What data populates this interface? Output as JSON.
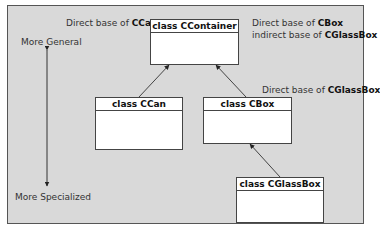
{
  "diagram": {
    "classes": [
      {
        "id": "ccontainer",
        "name": "class CContainer"
      },
      {
        "id": "ccan",
        "name": "class CCan"
      },
      {
        "id": "cbox",
        "name": "class CBox"
      },
      {
        "id": "cglassbox",
        "name": "class CGlassBox"
      }
    ],
    "annotations": {
      "ccan_base": {
        "prefix": "Direct base of ",
        "bold": "CCan"
      },
      "cbox_base": {
        "prefix": "Direct base of ",
        "bold": "CBox"
      },
      "cglassbox_indirect": {
        "prefix": "indirect base of ",
        "bold": "CGlassBox"
      },
      "cglassbox_direct": {
        "prefix": "Direct base of ",
        "bold": "CGlassBox"
      }
    },
    "axis": {
      "top_label": "More General",
      "bottom_label": "More Specialized"
    },
    "edges": [
      {
        "from": "CCan",
        "to": "CContainer"
      },
      {
        "from": "CBox",
        "to": "CContainer"
      },
      {
        "from": "CGlassBox",
        "to": "CBox"
      }
    ]
  },
  "colors": {
    "panel": "#d9d9d9",
    "box": "#ffffff",
    "line": "#333333"
  }
}
